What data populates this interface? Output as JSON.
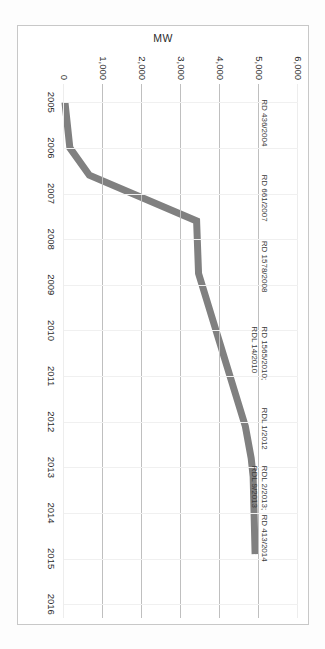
{
  "chart_data": {
    "type": "line",
    "title": "",
    "xlabel": "",
    "ylabel": "MW",
    "x": [
      2005,
      2006,
      2006.6,
      2007.6,
      2007.6,
      2008.75,
      2012.1,
      2012.8,
      2013.2,
      2014.9
    ],
    "values": [
      25,
      150,
      650,
      3400,
      3400,
      3450,
      4650,
      4800,
      4850,
      4900
    ],
    "xlim": [
      2004.6,
      2016.3
    ],
    "ylim": [
      0,
      6000
    ],
    "xticks": [
      "2005",
      "2006",
      "2007",
      "2008",
      "2009",
      "2010",
      "2011",
      "2012",
      "2013",
      "2014",
      "2015",
      "2016"
    ],
    "yticks": [
      "0",
      "1,000",
      "2,000",
      "3,000",
      "4,000",
      "5,000",
      "6,000"
    ],
    "grid": "horizontal-major",
    "legend": "none",
    "line_color": "#808080",
    "annotations": [
      {
        "lines": [
          "RD 436/2004"
        ],
        "x": 2005.45,
        "y": 5250
      },
      {
        "lines": [
          "RD 661/2007"
        ],
        "x": 2007.1,
        "y": 5250
      },
      {
        "lines": [
          "RD 1578/2008"
        ],
        "x": 2008.6,
        "y": 5250
      },
      {
        "lines": [
          "RD 1565/2010;",
          "RDL 14/2010"
        ],
        "x": 2010.5,
        "y": 5250
      },
      {
        "lines": [
          "RDL 1/2012"
        ],
        "x": 2012.15,
        "y": 5250
      },
      {
        "lines": [
          "RDL 2/2013;",
          "RDL 9/2013"
        ],
        "x": 2013.45,
        "y": 5250
      },
      {
        "lines": [
          "RD 413/2014"
        ],
        "x": 2014.55,
        "y": 5250
      }
    ]
  }
}
